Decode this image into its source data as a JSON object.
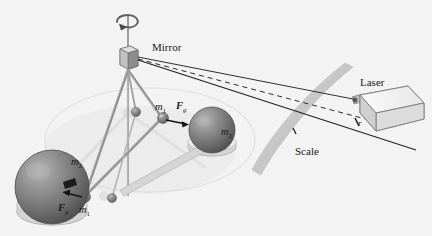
{
  "figure": {
    "background_color": "#f3f3f3",
    "width": 432,
    "height": 236
  },
  "labels": {
    "mirror": "Mirror",
    "laser": "Laser",
    "scale": "Scale",
    "distance_r": "r",
    "small_mass_top": "m",
    "small_mass_top_sub": "1",
    "small_mass_bottom": "m",
    "small_mass_bottom_sub": "1",
    "large_mass_right": "m",
    "large_mass_right_sub": "2",
    "large_mass_left": "m",
    "large_mass_left_sub": "2",
    "force_top": "F",
    "force_top_sub": "g",
    "force_bottom": "F",
    "force_bottom_sub": "g"
  },
  "colors": {
    "background": "#f3f3f3",
    "sphere_dark": "#6f6f6f",
    "sphere_highlight": "#a8a8a8",
    "sphere_shadow": "#4a4a4a",
    "base_light": "#e2e2e2",
    "rod_gray": "#9a9a9a",
    "beam_dark": "#2b2b2b",
    "scale_band": "#cfcfcf",
    "laser_body": "#efefef",
    "laser_edge": "#8a8a8a",
    "text": "#1a1a1a"
  },
  "elements": {
    "fiber": "vertical torsion fiber",
    "rotation_arrow": "curved rotation arrow at top of fiber",
    "mirror_box": "small cubic mirror mounted on fiber",
    "beam_incident": "solid beam line from mirror to laser",
    "beam_dashed": "dashed reference beam line",
    "beam_reflected": "solid reflected beam line to scale",
    "scale_arc": "curved gray measurement scale band",
    "laser_box": "rectangular laser source box",
    "dumbbell_arm": "torsion balance arm carrying the two small masses",
    "ghost_arm": "faded previous position of torsion arm",
    "large_sphere_left": "large lead sphere on left",
    "large_sphere_right": "large lead sphere on right",
    "small_sphere_top": "small mass on upper arm end",
    "small_sphere_bottom": "small mass on lower arm end"
  }
}
